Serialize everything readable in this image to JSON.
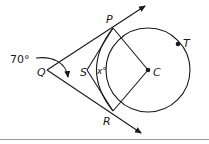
{
  "figure": {
    "type": "geometry-diagram",
    "points": {
      "P": {
        "label": "P"
      },
      "Q": {
        "label": "Q"
      },
      "R": {
        "label": "R"
      },
      "S": {
        "label": "S"
      },
      "C": {
        "label": "C"
      },
      "T": {
        "label": "T"
      }
    },
    "angle_label": "70°",
    "unknown_angle_label": "x°",
    "elements": [
      "tangent-ray QP",
      "tangent-ray QR",
      "circle centered at C",
      "segments SP, SR, CP, CR",
      "arc PSR"
    ]
  }
}
